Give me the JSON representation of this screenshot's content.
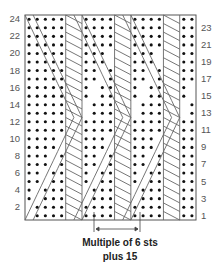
{
  "chart": {
    "rows": 24,
    "columns": 21,
    "grid": {
      "left": 25,
      "top": 15,
      "right": 196,
      "bottom": 220
    },
    "row_labels_left": [
      "24",
      "22",
      "20",
      "18",
      "16",
      "14",
      "12",
      "10",
      "8",
      "6",
      "4",
      "2"
    ],
    "row_labels_right": [
      "23",
      "21",
      "19",
      "17",
      "15",
      "13",
      "11",
      "9",
      "7",
      "5",
      "3",
      "1"
    ],
    "symbols": {
      "dot": "purl stitch",
      "blank": "knit stitch",
      "diagonal": "travelling cable stitch"
    },
    "repeat_marker": {
      "from_x": 94,
      "to_x": 140,
      "label": "repeat"
    },
    "colors": {
      "grid_line": "#8a8a8a",
      "dot": "#111111",
      "cable_line": "#666666",
      "border": "#555555",
      "background": "#ffffff"
    }
  },
  "caption": {
    "line1": "Multiple of 6 sts",
    "line2": "plus 15"
  }
}
